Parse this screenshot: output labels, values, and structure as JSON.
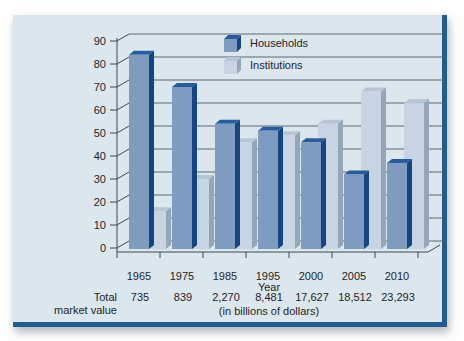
{
  "card": {
    "background": "#dce7ed",
    "border_color": "#1f5c92"
  },
  "chart_data": {
    "type": "bar",
    "style": "3d-bars",
    "categories": [
      "1965",
      "1975",
      "1985",
      "1995",
      "2000",
      "2005",
      "2010"
    ],
    "series": [
      {
        "name": "Households",
        "values": [
          84,
          70,
          54,
          51,
          46,
          32,
          37
        ],
        "colors": {
          "front": "#7e9cc0",
          "side": "#164584",
          "top": "#265c9d"
        }
      },
      {
        "name": "Institutions",
        "values": [
          16,
          30,
          46,
          49,
          54,
          68,
          63
        ],
        "colors": {
          "front": "#c8d4e1",
          "side": "#93a7b8",
          "top": "#b7c6d4"
        }
      }
    ],
    "title": "",
    "xlabel": "Year",
    "ylabel": "",
    "ylim": [
      0,
      90
    ],
    "yticks": [
      0,
      10,
      20,
      30,
      40,
      50,
      60,
      70,
      80,
      90
    ],
    "grid": true,
    "legend_position": "top-center",
    "grid_color": "#5a6875",
    "axis_color": "#3d4a56",
    "text_color": "#1e2429"
  },
  "table": {
    "label_line1": "Total",
    "label_line2": "market value",
    "values": [
      "735",
      "839",
      "2,270",
      "8,481",
      "17,627",
      "18,512",
      "23,293"
    ],
    "note": "(in billions of dollars)"
  }
}
